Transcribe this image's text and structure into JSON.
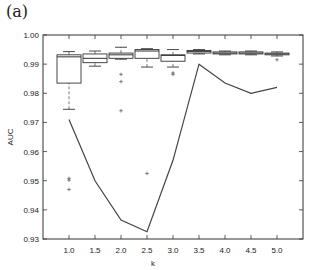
{
  "panel_label": "(a)",
  "chart_data": {
    "type": "box+line",
    "title": "",
    "xlabel": "k",
    "ylabel": "AUC",
    "ylim": [
      0.93,
      1.0
    ],
    "xlim": [
      0.5,
      5.5
    ],
    "x_ticks": [
      "1.0",
      "1.5",
      "2.0",
      "2.5",
      "3.0",
      "3.5",
      "4.0",
      "4.5",
      "5.0"
    ],
    "y_ticks": [
      "0.93",
      "0.94",
      "0.95",
      "0.96",
      "0.97",
      "0.98",
      "0.99",
      "1.00"
    ],
    "grid": false,
    "legend": null,
    "boxplot": [
      {
        "x": 1.0,
        "whisker_low": 0.9745,
        "q1": 0.9835,
        "median": 0.9925,
        "q3": 0.9932,
        "whisker_high": 0.9943,
        "outliers": [
          0.9508,
          0.9502,
          0.947
        ]
      },
      {
        "x": 1.5,
        "whisker_low": 0.9893,
        "q1": 0.9905,
        "median": 0.992,
        "q3": 0.9935,
        "whisker_high": 0.9945,
        "outliers": []
      },
      {
        "x": 2.0,
        "whisker_low": 0.9917,
        "q1": 0.992,
        "median": 0.9932,
        "q3": 0.9938,
        "whisker_high": 0.9958,
        "outliers": [
          0.9865,
          0.984,
          0.974
        ]
      },
      {
        "x": 2.5,
        "whisker_low": 0.989,
        "q1": 0.992,
        "median": 0.9945,
        "q3": 0.995,
        "whisker_high": 0.9953,
        "outliers": [
          0.9525
        ]
      },
      {
        "x": 3.0,
        "whisker_low": 0.989,
        "q1": 0.991,
        "median": 0.993,
        "q3": 0.9932,
        "whisker_high": 0.995,
        "outliers": [
          0.987,
          0.9865
        ]
      },
      {
        "x": 3.5,
        "whisker_low": 0.9935,
        "q1": 0.9938,
        "median": 0.9943,
        "q3": 0.9947,
        "whisker_high": 0.995,
        "outliers": []
      },
      {
        "x": 4.0,
        "whisker_low": 0.9932,
        "q1": 0.9935,
        "median": 0.9938,
        "q3": 0.9942,
        "whisker_high": 0.9945,
        "outliers": []
      },
      {
        "x": 4.5,
        "whisker_low": 0.9932,
        "q1": 0.9935,
        "median": 0.9938,
        "q3": 0.9942,
        "whisker_high": 0.9945,
        "outliers": []
      },
      {
        "x": 5.0,
        "whisker_low": 0.9928,
        "q1": 0.9932,
        "median": 0.9935,
        "q3": 0.9938,
        "whisker_high": 0.9942,
        "outliers": [
          0.9915
        ]
      }
    ],
    "line": {
      "x": [
        1.0,
        1.5,
        2.0,
        2.5,
        3.0,
        3.5,
        4.0,
        4.5,
        5.0
      ],
      "values": [
        0.971,
        0.95,
        0.9365,
        0.9325,
        0.957,
        0.99,
        0.9835,
        0.98,
        0.982
      ]
    }
  }
}
